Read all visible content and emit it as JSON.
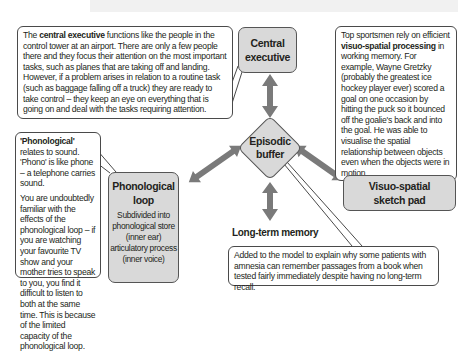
{
  "diagram": {
    "components": {
      "central_executive": {
        "label_line1": "Central",
        "label_line2": "executive"
      },
      "episodic_buffer": {
        "label_line1": "Episodic",
        "label_line2": "buffer"
      },
      "phonological_loop": {
        "label_line1": "Phonological",
        "label_line2": "loop",
        "detail": [
          "Subdivided  into",
          "phonological store",
          "(inner ear)",
          "articulatory process",
          "(inner voice)"
        ]
      },
      "visuo_spatial": {
        "label_line1": "Visuo-spatial",
        "label_line2": "sketch pad"
      },
      "long_term_memory": {
        "label": "Long-term memory"
      }
    },
    "callouts": {
      "central_executive": {
        "pre": "The ",
        "bold": "central executive",
        "post": " functions like the people in the control tower at an airport. There are only a few people there and they focus their attention on the most important tasks, such as planes that are taking off and landing. However, if a problem arises in relation to a routine task (such as baggage falling off a truck) they are ready to take control – they keep an eye on everything that is going on and deal with the tasks requiring attention."
      },
      "visuo_spatial": {
        "pre": "Top sportsmen rely on efficient ",
        "bold": "visuo-spatial processing",
        "post": " in working memory. For example, Wayne Gretzky (probably the greatest ice hockey player ever) scored a goal on one occasion by hitting the puck so it bounced off the goalie's back and into the goal. He was able to visualise the spatial relationship between objects even when the objects were in motion."
      },
      "phonological": {
        "bold": "'Phonological'",
        "post": " relates to sound. 'Phono' is like phone – a telephone carries sound.",
        "para2": "You are undoubtedly familiar with the effects of the phonological loop – if you are watching your favourite TV show and your mother tries to speak to you, you find it difficult to listen to both at the same time. This is because of the limited capacity of the phonological loop."
      },
      "episodic_buffer": {
        "text": "Added to the model to explain why some patients with amnesia can remember passages from a book when tested fairly immediately despite having no long-term recall."
      }
    },
    "colors": {
      "box_fill": "#d9d9d9",
      "box_border": "#555555",
      "arrow": "#7a7a7a",
      "callout_border": "#4a4a4a",
      "text": "#231f20"
    }
  }
}
